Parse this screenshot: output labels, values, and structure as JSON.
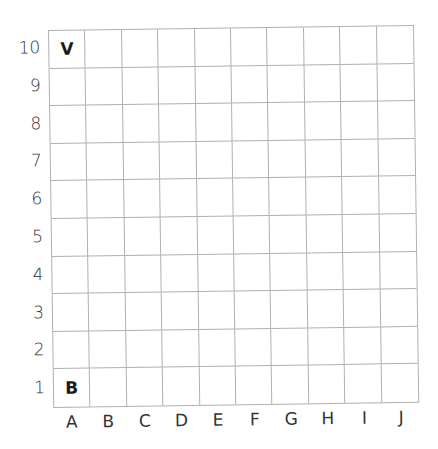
{
  "grid": {
    "columns": [
      "A",
      "B",
      "C",
      "D",
      "E",
      "F",
      "G",
      "H",
      "I",
      "J"
    ],
    "rows": [
      "10",
      "9",
      "8",
      "7",
      "6",
      "5",
      "4",
      "3",
      "2",
      "1"
    ],
    "pieces": [
      {
        "label": "V",
        "col": 0,
        "row": 0,
        "coord": "A10"
      },
      {
        "label": "B",
        "col": 0,
        "row": 9,
        "coord": "A1"
      }
    ]
  },
  "colors": {
    "grid_line": "#b0b0b0",
    "text": "#333333",
    "piece": "#1a1a1a"
  }
}
